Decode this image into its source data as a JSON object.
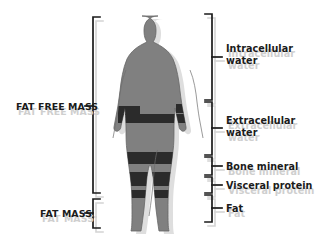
{
  "diagram": {
    "figure": {
      "name": "human-body-silhouette",
      "body_color": "#808080",
      "band_color": "#2b2b2b",
      "outline_color": "#5a5a5a",
      "shadow_color": "#d9d9d9"
    },
    "style": {
      "bracket_color": "#1b1b1b",
      "ghost_color": "#cfcfcf",
      "text_color": "#1b1b1b",
      "background": "#ffffff"
    },
    "left_labels": [
      {
        "id": "fat-free-mass",
        "text": "FAT FREE MASS",
        "ghost": "FAT FREE MASS"
      },
      {
        "id": "fat-mass",
        "text": "FAT MASS",
        "ghost": "FAT MASS"
      }
    ],
    "right_labels": [
      {
        "id": "intracellular-water",
        "line1": "Intracellular",
        "line2": "water",
        "ghost1": "Intracellular",
        "ghost2": "water"
      },
      {
        "id": "extracellular-water",
        "line1": "Extracellular",
        "line2": "water",
        "ghost1": "Extracellular",
        "ghost2": "water"
      },
      {
        "id": "bone-mineral",
        "line1": "Bone mineral",
        "line2": "",
        "ghost1": "Bone mineral",
        "ghost2": ""
      },
      {
        "id": "visceral-protein",
        "line1": "Visceral protein",
        "line2": "",
        "ghost1": "Visceral protein",
        "ghost2": ""
      },
      {
        "id": "fat",
        "line1": "Fat",
        "line2": "",
        "ghost1": "Fat",
        "ghost2": ""
      }
    ]
  }
}
